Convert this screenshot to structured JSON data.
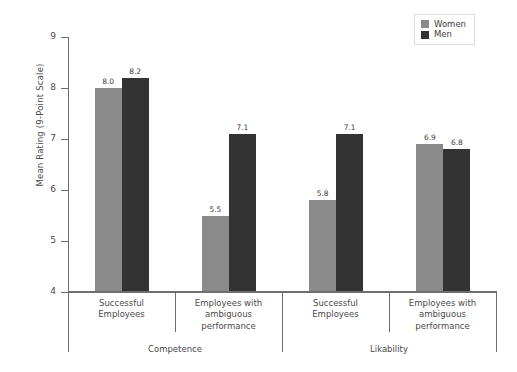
{
  "chart_data": {
    "type": "bar",
    "title": "",
    "subtitle": "",
    "xlabel": "",
    "ylabel": "Mean Rating (9-Point Scale)",
    "ylim": [
      4,
      9
    ],
    "yticks": [
      "4",
      "5",
      "6",
      "7",
      "8",
      "9"
    ],
    "grid": false,
    "legend_position": "top-right",
    "categories": [
      "Successful\nEmployees",
      "Employees with\nambiguous\nperformance",
      "Successful\nEmployees",
      "Employees with\nambiguous\nperformance"
    ],
    "groups": [
      "Competence",
      "Likability"
    ],
    "series": [
      {
        "name": "Women",
        "color": "#8a8a8a",
        "values": [
          8.0,
          5.5,
          5.8,
          6.9
        ]
      },
      {
        "name": "Men",
        "color": "#333333",
        "values": [
          8.2,
          7.1,
          7.1,
          6.8
        ]
      }
    ],
    "data_labels": [
      "8.0",
      "8.2",
      "5.5",
      "7.1",
      "5.8",
      "7.1",
      "6.9",
      "6.8"
    ]
  },
  "legend": {
    "items": [
      {
        "label": "Women",
        "swatch": "women-color-swatch"
      },
      {
        "label": "Men",
        "swatch": "men-color-swatch"
      }
    ]
  },
  "axes": {
    "y_title": "Mean Rating (9-Point Scale)",
    "y_ticks": [
      {
        "label": "9",
        "value": 9
      },
      {
        "label": "8",
        "value": 8
      },
      {
        "label": "7",
        "value": 7
      },
      {
        "label": "6",
        "value": 6
      },
      {
        "label": "5",
        "value": 5
      },
      {
        "label": "4",
        "value": 4
      }
    ],
    "categories": [
      {
        "line1": "Successful",
        "line2": "Employees",
        "line3": ""
      },
      {
        "line1": "Employees with",
        "line2": "ambiguous",
        "line3": "performance"
      },
      {
        "line1": "Successful",
        "line2": "Employees",
        "line3": ""
      },
      {
        "line1": "Employees with",
        "line2": "ambiguous",
        "line3": "performance"
      }
    ],
    "groups": [
      {
        "label": "Competence"
      },
      {
        "label": "Likability"
      }
    ]
  },
  "bars": [
    {
      "value_label": "8.0",
      "series": "Women"
    },
    {
      "value_label": "8.2",
      "series": "Men"
    },
    {
      "value_label": "5.5",
      "series": "Women"
    },
    {
      "value_label": "7.1",
      "series": "Men"
    },
    {
      "value_label": "5.8",
      "series": "Women"
    },
    {
      "value_label": "7.1",
      "series": "Men"
    },
    {
      "value_label": "6.9",
      "series": "Women"
    },
    {
      "value_label": "6.8",
      "series": "Men"
    }
  ],
  "colors": {
    "women": "#8a8a8a",
    "men": "#333333",
    "axis": "#6e6e6e",
    "text": "#4a4a4a",
    "background": "#ffffff"
  }
}
